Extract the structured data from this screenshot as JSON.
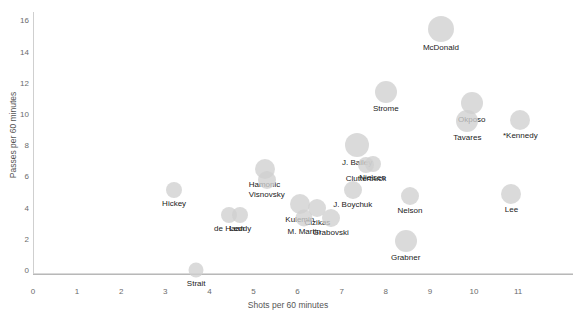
{
  "chart_data": {
    "type": "scatter",
    "title": "",
    "xlabel": "Shots per 60 minutes",
    "ylabel": "Passes per 60 minutes",
    "xlim": [
      0,
      11.9
    ],
    "ylim": [
      -0.6,
      16.6
    ],
    "xticks": [
      0,
      1,
      2,
      3,
      4,
      5,
      6,
      7,
      8,
      9,
      10,
      11
    ],
    "yticks": [
      0,
      2,
      4,
      6,
      8,
      10,
      12,
      14,
      16
    ],
    "grid": false,
    "legend": "none",
    "marker_color": "#cfcfcf",
    "points": [
      {
        "label": "McDonald",
        "x": 9.25,
        "y": 15.45,
        "size": 26
      },
      {
        "label": "Strome",
        "x": 8.0,
        "y": 11.4,
        "size": 22
      },
      {
        "label": "Okposo",
        "x": 9.95,
        "y": 10.7,
        "size": 22
      },
      {
        "label": "Tavares",
        "x": 9.85,
        "y": 9.55,
        "size": 22
      },
      {
        "label": "*Kennedy",
        "x": 11.05,
        "y": 9.6,
        "size": 20
      },
      {
        "label": "J. Bailey",
        "x": 7.35,
        "y": 8.0,
        "size": 24
      },
      {
        "label": "Nielsen",
        "x": 7.7,
        "y": 6.8,
        "size": 16
      },
      {
        "label": "Clutterbuck",
        "x": 7.55,
        "y": 6.75,
        "size": 16
      },
      {
        "label": "Hamonic",
        "x": 5.25,
        "y": 6.5,
        "size": 20
      },
      {
        "label": "Visnovsky",
        "x": 5.3,
        "y": 5.75,
        "size": 18
      },
      {
        "label": "Hickey",
        "x": 3.2,
        "y": 5.15,
        "size": 16
      },
      {
        "label": "J. Boychuk",
        "x": 7.25,
        "y": 5.15,
        "size": 18
      },
      {
        "label": "Lee",
        "x": 10.85,
        "y": 4.85,
        "size": 20
      },
      {
        "label": "Nelson",
        "x": 8.55,
        "y": 4.75,
        "size": 18
      },
      {
        "label": "Kulemin",
        "x": 6.05,
        "y": 4.25,
        "size": 20
      },
      {
        "label": "Cizikas",
        "x": 6.45,
        "y": 4.0,
        "size": 18
      },
      {
        "label": "de Haan",
        "x": 4.45,
        "y": 3.55,
        "size": 16
      },
      {
        "label": "Leddy",
        "x": 4.7,
        "y": 3.5,
        "size": 16
      },
      {
        "label": "M. Martin",
        "x": 6.15,
        "y": 3.35,
        "size": 17
      },
      {
        "label": "Grabovski",
        "x": 6.75,
        "y": 3.35,
        "size": 18
      },
      {
        "label": "Grabner",
        "x": 8.45,
        "y": 1.85,
        "size": 22
      },
      {
        "label": "Strait",
        "x": 3.7,
        "y": 0.0,
        "size": 15
      }
    ]
  }
}
